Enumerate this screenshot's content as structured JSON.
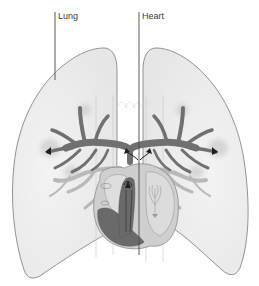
{
  "diagram": {
    "labels": [
      {
        "id": "lung",
        "text": "Lung"
      },
      {
        "id": "heart",
        "text": "Heart"
      }
    ],
    "colors": {
      "lung_fill": "#ececec",
      "lung_outline": "#7a7a7a",
      "bronchi": "#6f6f6f",
      "vessels": "#b9b9b9",
      "heart_outer": "#cfcfcf",
      "heart_inner_light": "#dedede",
      "heart_chamber_dark": "#6a6a6a",
      "leader_line": "#4a4a4a",
      "arrow": "#1e1e1e"
    }
  }
}
